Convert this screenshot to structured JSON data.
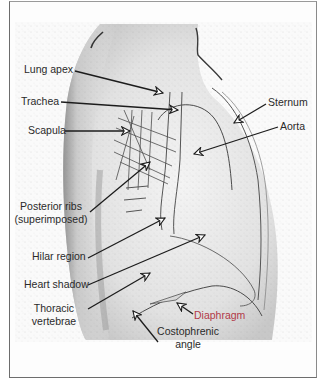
{
  "figure": {
    "type": "labeled lateral chest radiograph",
    "colors": {
      "frame": "#6d6d6d",
      "background": "#fdfdfd",
      "xray_dark": "#3a3a3a",
      "leader_line": "#1c1c1c",
      "label_text": "#2a2a2a",
      "diaphragm_label": "#b23a48"
    },
    "labels_left": [
      {
        "id": "lung-apex",
        "text": "Lung apex"
      },
      {
        "id": "trachea",
        "text": "Trachea"
      },
      {
        "id": "scapula",
        "text": "Scapula"
      },
      {
        "id": "posterior-ribs",
        "line1": "Posterior ribs",
        "line2": "(superimposed)"
      },
      {
        "id": "hilar-region",
        "text": "Hilar region"
      },
      {
        "id": "heart-shadow",
        "text": "Heart shadow"
      },
      {
        "id": "thoracic-vertebrae",
        "line1": "Thoracic",
        "line2": "vertebrae"
      }
    ],
    "labels_right": [
      {
        "id": "sternum",
        "text": "Sternum"
      },
      {
        "id": "aorta",
        "text": "Aorta"
      }
    ],
    "labels_bottom": [
      {
        "id": "diaphragm",
        "text": "Diaphragm"
      },
      {
        "id": "costophrenic-angle",
        "line1": "Costophrenic",
        "line2": "angle"
      }
    ]
  }
}
